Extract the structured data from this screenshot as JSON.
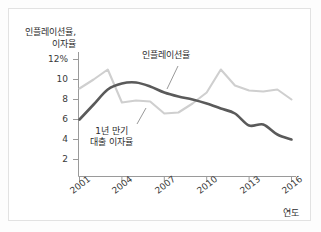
{
  "figure": {
    "background": "#ffffff",
    "border_color": "#e2e2e2"
  },
  "axes": {
    "y_title_line1": "인플레이션율,",
    "y_title_line2": "이자율",
    "x_title": "연도"
  },
  "annotations": {
    "inflation": "인플레이션율",
    "loan_line1": "1년 만기",
    "loan_line2": "대출 이자율"
  },
  "colors": {
    "inflation_line": "#cfcfcf",
    "loan_line": "#5a5a5a",
    "axis": "#9a9a9a",
    "text": "#2e2e2e"
  },
  "chart_data": {
    "type": "line",
    "title": "",
    "xlabel": "연도",
    "ylabel": "인플레이션율, 이자율",
    "xlim": [
      2001,
      2016
    ],
    "ylim": [
      0,
      12
    ],
    "ytick_labels": [
      "12%",
      "10",
      "8",
      "6",
      "4",
      "2"
    ],
    "ytick_values": [
      12,
      10,
      8,
      6,
      4,
      2
    ],
    "xtick_labels": [
      "2001",
      "2004",
      "2007",
      "2010",
      "2013",
      "2016"
    ],
    "xtick_values": [
      2001,
      2004,
      2007,
      2010,
      2013,
      2016
    ],
    "grid": false,
    "legend": "annotations",
    "x": [
      2001,
      2002,
      2003,
      2004,
      2005,
      2006,
      2007,
      2008,
      2009,
      2010,
      2011,
      2012,
      2013,
      2014,
      2015,
      2016
    ],
    "series": [
      {
        "name": "인플레이션율",
        "color": "#cfcfcf",
        "values": [
          9.1,
          10.0,
          11.0,
          7.7,
          7.9,
          7.8,
          6.6,
          6.7,
          7.6,
          8.7,
          11.0,
          9.4,
          8.9,
          8.8,
          9.0,
          8.0
        ]
      },
      {
        "name": "1년 만기 대출 이자율",
        "color": "#5a5a5a",
        "values": [
          6.0,
          7.5,
          9.0,
          9.6,
          9.7,
          9.3,
          8.7,
          8.3,
          8.0,
          7.6,
          7.1,
          6.6,
          5.4,
          5.5,
          4.5,
          4.0
        ]
      }
    ]
  }
}
